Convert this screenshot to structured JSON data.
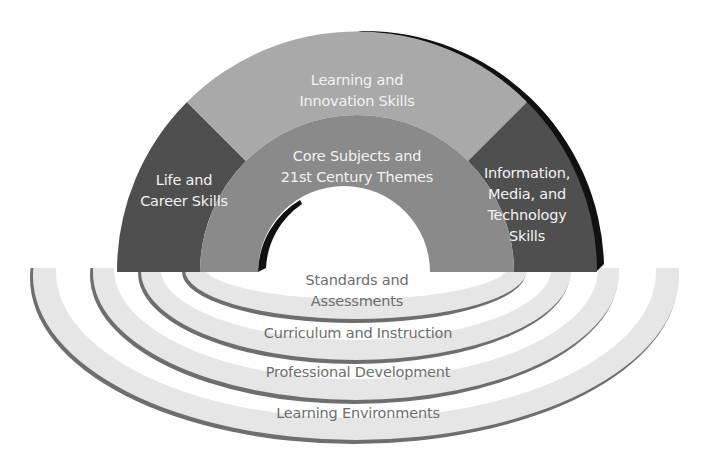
{
  "diagram": {
    "colors": {
      "background": "#ffffff",
      "outer_dark_segment": "#4f4f4f",
      "outer_light_segment": "#a9a9a9",
      "core_ring": "#8a8a8a",
      "arch_shadow": "#111111",
      "support_ring_fill": "#e6e6e6",
      "support_ring_edge": "#6e6e6e",
      "label_light": "#f2f2f2",
      "label_dark": "#6d6d6d"
    },
    "outcomes_arch": {
      "segments": [
        {
          "id": "life-career",
          "lines": [
            "Life and",
            "Career Skills"
          ]
        },
        {
          "id": "learning-innovation",
          "lines": [
            "Learning and",
            "Innovation Skills"
          ]
        },
        {
          "id": "info-media-tech",
          "lines": [
            "Information,",
            "Media, and",
            "Technology",
            "Skills"
          ]
        }
      ],
      "core": {
        "lines": [
          "Core Subjects and",
          "21st Century Themes"
        ]
      }
    },
    "support_systems": {
      "rings": [
        {
          "id": "standards",
          "lines": [
            "Standards and",
            "Assessments"
          ]
        },
        {
          "id": "curriculum",
          "lines": [
            "Curriculum and Instruction"
          ]
        },
        {
          "id": "professional-development",
          "lines": [
            "Professional Development"
          ]
        },
        {
          "id": "learning-environments",
          "lines": [
            "Learning Environments"
          ]
        }
      ]
    }
  }
}
